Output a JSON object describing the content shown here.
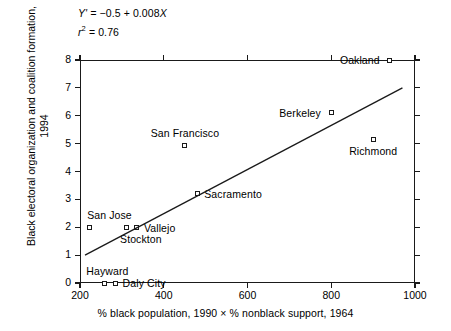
{
  "chart_data": {
    "type": "scatter",
    "title": "",
    "xlabel": "% black population, 1990 × % nonblack support, 1964",
    "ylabel": "Black electoral organization and coalition formation, 1994",
    "xlim": [
      160,
      1040
    ],
    "ylim": [
      -0.45,
      8.5
    ],
    "xticks": [
      200,
      400,
      600,
      800,
      1000
    ],
    "yticks": [
      0,
      1,
      2,
      3,
      4,
      5,
      6,
      7,
      8
    ],
    "grid": false,
    "legend": null,
    "annotations": {
      "equation_y": "Y' =",
      "equation_rhs": "−0.5 + 0.008",
      "equation_x": "X",
      "r_symbol": "r",
      "r_exponent": "2",
      "r_value": "= 0.76"
    },
    "fit_line": {
      "label": "least-squares regression line",
      "intercept": -0.5,
      "slope": 0.008,
      "x_start": 212,
      "y_start": 1.0,
      "x_end": 970,
      "y_end": 7.0
    },
    "points": [
      {
        "label": "Oakland",
        "x": 940,
        "y": 8.0,
        "label_pos": "left"
      },
      {
        "label": "Berkeley",
        "x": 800,
        "y": 6.1,
        "label_pos": "left"
      },
      {
        "label": "Richmond",
        "x": 900,
        "y": 5.15,
        "label_pos": "below"
      },
      {
        "label": "San Francisco",
        "x": 450,
        "y": 4.95,
        "label_pos": "above"
      },
      {
        "label": "Sacramento",
        "x": 480,
        "y": 3.2,
        "label_pos": "right"
      },
      {
        "label": "San Jose",
        "x": 222,
        "y": 2.0,
        "label_pos": "above"
      },
      {
        "label": "Stockton",
        "x": 310,
        "y": 2.0,
        "label_pos": "below"
      },
      {
        "label": "Vallejo",
        "x": 336,
        "y": 2.0,
        "label_pos": "right"
      },
      {
        "label": "Hayward",
        "x": 258,
        "y": 0.0,
        "label_pos": "above"
      },
      {
        "label": "Daly City",
        "x": 285,
        "y": 0.0,
        "label_pos": "right"
      }
    ]
  },
  "axes": {
    "x_tick_labels": [
      "200",
      "400",
      "600",
      "800",
      "1000"
    ],
    "y_tick_labels": [
      "0",
      "1",
      "2",
      "3",
      "4",
      "5",
      "6",
      "7",
      "8"
    ],
    "x_title": "% black population, 1990 × % nonblack support, 1964",
    "y_title": "Black electoral organization and coalition formation, 1994"
  },
  "colors": {
    "axis": "#1a1a1a",
    "marker_edge": "#1a1a1a",
    "marker_fill": "#ffffff",
    "line": "#1a1a1a",
    "background": "#ffffff"
  }
}
